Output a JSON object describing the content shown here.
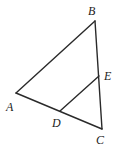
{
  "diagram": {
    "type": "triangle",
    "stroke_color": "#2a2a2a",
    "points": {
      "A": {
        "label": "A",
        "x": 16,
        "y": 93,
        "lx": 6,
        "ly": 111
      },
      "B": {
        "label": "B",
        "x": 95,
        "y": 21,
        "lx": 88,
        "ly": 15
      },
      "C": {
        "label": "C",
        "x": 102,
        "y": 129,
        "lx": 96,
        "ly": 144
      },
      "D": {
        "label": "D",
        "x": 60,
        "y": 111,
        "lx": 52,
        "ly": 127
      },
      "E": {
        "label": "E",
        "x": 99,
        "y": 76,
        "lx": 104,
        "ly": 80
      }
    },
    "segments": [
      {
        "from": "A",
        "to": "B"
      },
      {
        "from": "B",
        "to": "C"
      },
      {
        "from": "A",
        "to": "C"
      },
      {
        "from": "D",
        "to": "E"
      }
    ]
  }
}
